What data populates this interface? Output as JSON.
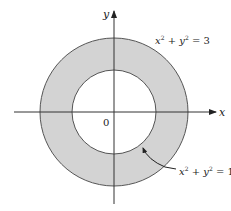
{
  "diagram": {
    "type": "annulus-region",
    "colors": {
      "region_fill": "#d3d3d3",
      "stroke": "#444444",
      "axis": "#333333",
      "background": "#ffffff"
    },
    "axes": {
      "x_label": "x",
      "y_label": "y",
      "origin_label": "0"
    },
    "circles": {
      "outer": {
        "equation_lhs": "x² + y² = 3",
        "var1": "x",
        "var2": "y",
        "exp": "2",
        "rhs": "3"
      },
      "inner": {
        "equation_lhs": "x² + y² = 1",
        "var1": "x",
        "var2": "y",
        "exp": "2",
        "rhs": "1"
      }
    }
  }
}
